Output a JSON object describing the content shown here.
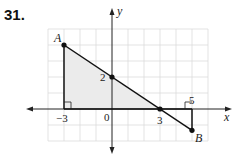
{
  "problem": {
    "number": "31."
  },
  "axes": {
    "x_label": "x",
    "y_label": "y",
    "origin_label": "0"
  },
  "grid": {
    "x_min": -4,
    "x_max": 6,
    "y_min": -2,
    "y_max": 5,
    "unit_px": 16,
    "origin_px": [
      112,
      109
    ]
  },
  "points": [
    {
      "name": "A",
      "x": -3,
      "y": 4,
      "label": "A"
    },
    {
      "name": "y-intercept",
      "x": 0,
      "y": 2,
      "label": "2"
    },
    {
      "name": "x-intercept",
      "x": 3,
      "y": 0,
      "label": "3"
    },
    {
      "name": "B",
      "x": 5,
      "y": -1.3333,
      "label": "B"
    }
  ],
  "tick_labels": [
    {
      "value": "-3",
      "text": "−3"
    },
    {
      "value": "0",
      "text": "0"
    },
    {
      "value": "2",
      "text": "2"
    },
    {
      "value": "3",
      "text": "3"
    },
    {
      "value": "5",
      "text": "5"
    }
  ],
  "line": {
    "from": "A",
    "to": "B",
    "slope": "-2/3",
    "y_intercept": 2
  },
  "shaded_triangle": [
    [
      -3,
      4
    ],
    [
      -3,
      0
    ],
    [
      3,
      0
    ]
  ],
  "small_triangle": [
    [
      3,
      0
    ],
    [
      5,
      0
    ],
    [
      5,
      -1.3333
    ]
  ],
  "right_angles": [
    [
      -3,
      0
    ],
    [
      5,
      0
    ]
  ],
  "colors": {
    "grid": "#d9d9d9",
    "shade": "#ececec",
    "line": "#111111",
    "axis": "#222222"
  }
}
